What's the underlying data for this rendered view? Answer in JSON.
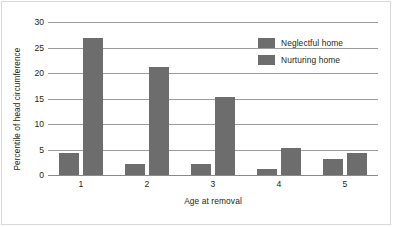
{
  "chart_data": {
    "type": "bar",
    "title": "",
    "xlabel": "Age at removal",
    "ylabel": "Percentile of head circumference",
    "categories": [
      "1",
      "2",
      "3",
      "4",
      "5"
    ],
    "series": [
      {
        "name": "Neglectful home",
        "values": [
          4.3,
          2.2,
          2.2,
          1.2,
          3.1
        ],
        "color": "#6d6d6d"
      },
      {
        "name": "Nurturing home",
        "values": [
          26.9,
          21.1,
          15.3,
          5.3,
          4.3
        ],
        "color": "#6d6d6d"
      }
    ],
    "ylim": [
      0,
      30
    ],
    "yticks": [
      0,
      5,
      10,
      15,
      20,
      25,
      30
    ],
    "ytick_labels": [
      "0",
      "5",
      "10",
      "15",
      "20",
      "25",
      "30"
    ],
    "grid": true,
    "legend_position": "top-right"
  },
  "legend": {
    "entries": [
      {
        "label": "Neglectful home"
      },
      {
        "label": "Nurturing home"
      }
    ]
  }
}
